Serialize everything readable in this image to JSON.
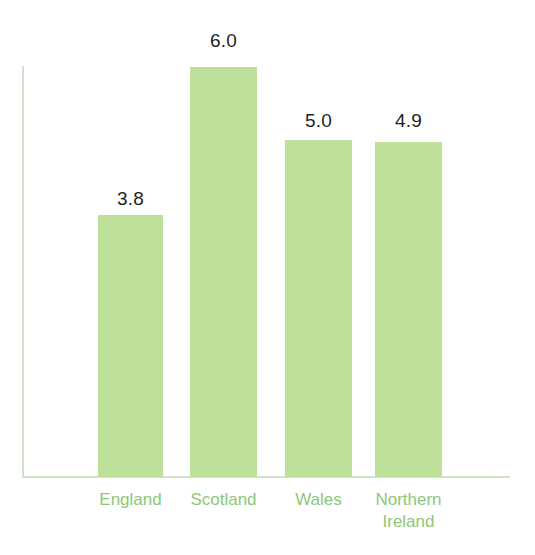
{
  "chart_data": {
    "type": "bar",
    "title": "",
    "subtitle": "",
    "xlabel": "",
    "ylabel": "",
    "categories": [
      "England",
      "Scotland",
      "Wales",
      "Northern\nIreland"
    ],
    "values": [
      3.8,
      6.0,
      5.0,
      4.9
    ],
    "value_labels": [
      "3.8",
      "6.0",
      "5.0",
      "4.9"
    ],
    "ylim": [
      0,
      6.0
    ],
    "grid": false,
    "legend": null,
    "axis_ticks": [],
    "colors": {
      "bar_fill": "#bfe09b",
      "value_label": "#231f20",
      "category_label": "#8cc878",
      "axis_line": "#cfe3cb",
      "background": "#ffffff"
    },
    "bars": [
      {
        "category": "England",
        "value": 3.8,
        "value_label": "3.8",
        "label_lines": [
          "England"
        ],
        "left_px": 98,
        "width_px": 65,
        "top_px": 215,
        "label_top_px": 188,
        "label_left_px": 78,
        "label_width_px": 105
      },
      {
        "category": "Scotland",
        "value": 6.0,
        "value_label": "6.0",
        "label_lines": [
          "Scotland"
        ],
        "left_px": 190,
        "width_px": 67,
        "top_px": 67,
        "label_top_px": 30,
        "label_left_px": 171,
        "label_width_px": 105
      },
      {
        "category": "Wales",
        "value": 5.0,
        "value_label": "5.0",
        "label_lines": [
          "Wales"
        ],
        "left_px": 285,
        "width_px": 67,
        "top_px": 140,
        "label_top_px": 110,
        "label_left_px": 266,
        "label_width_px": 105
      },
      {
        "category": "Northern Ireland",
        "value": 4.9,
        "value_label": "4.9",
        "label_lines": [
          "Northern",
          "Ireland"
        ],
        "left_px": 375,
        "width_px": 67,
        "top_px": 142,
        "label_top_px": 110,
        "label_left_px": 356,
        "label_width_px": 105
      }
    ]
  }
}
